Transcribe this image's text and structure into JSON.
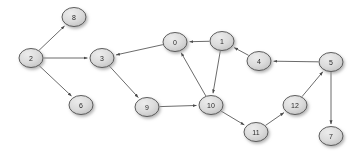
{
  "diagram": {
    "type": "directed-graph",
    "width": 362,
    "height": 156,
    "background_color": "#ffffff",
    "node_style": {
      "fill_color": "#d4d4d4",
      "fill_gradient_light": "#e8e8e8",
      "fill_gradient_dark": "#c2c2c2",
      "stroke_color": "#4d4d4d",
      "label_color": "#2b2b2b",
      "shadow_color": "#b4b4b4",
      "rx": 12,
      "ry": 9.5
    },
    "edge_style": {
      "stroke_color": "#5a5a5a",
      "stroke_width": 0.9,
      "arrowhead": "filled-triangle"
    },
    "nodes": [
      {
        "id": "n0",
        "label": "0",
        "x": 175,
        "y": 42
      },
      {
        "id": "n1",
        "label": "1",
        "x": 222,
        "y": 41
      },
      {
        "id": "n2",
        "label": "2",
        "x": 31,
        "y": 58
      },
      {
        "id": "n3",
        "label": "3",
        "x": 102,
        "y": 58
      },
      {
        "id": "n4",
        "label": "4",
        "x": 259,
        "y": 61
      },
      {
        "id": "n5",
        "label": "5",
        "x": 331,
        "y": 62
      },
      {
        "id": "n6",
        "label": "6",
        "x": 81,
        "y": 105
      },
      {
        "id": "n7",
        "label": "7",
        "x": 331,
        "y": 136
      },
      {
        "id": "n8",
        "label": "8",
        "x": 74,
        "y": 17
      },
      {
        "id": "n9",
        "label": "9",
        "x": 147,
        "y": 107
      },
      {
        "id": "n10",
        "label": "10",
        "x": 211,
        "y": 105
      },
      {
        "id": "n11",
        "label": "11",
        "x": 256,
        "y": 132
      },
      {
        "id": "n12",
        "label": "12",
        "x": 295,
        "y": 105
      }
    ],
    "edges": [
      {
        "from": "n2",
        "to": "n8"
      },
      {
        "from": "n2",
        "to": "n3"
      },
      {
        "from": "n2",
        "to": "n6"
      },
      {
        "from": "n3",
        "to": "n9"
      },
      {
        "from": "n0",
        "to": "n3"
      },
      {
        "from": "n1",
        "to": "n0"
      },
      {
        "from": "n10",
        "to": "n0"
      },
      {
        "from": "n1",
        "to": "n10"
      },
      {
        "from": "n4",
        "to": "n1"
      },
      {
        "from": "n5",
        "to": "n4"
      },
      {
        "from": "n9",
        "to": "n10"
      },
      {
        "from": "n10",
        "to": "n11"
      },
      {
        "from": "n11",
        "to": "n12"
      },
      {
        "from": "n12",
        "to": "n5"
      },
      {
        "from": "n5",
        "to": "n7"
      }
    ]
  }
}
